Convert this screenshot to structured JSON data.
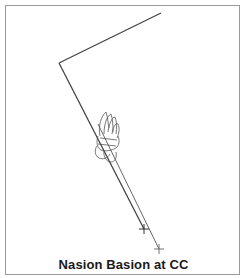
{
  "figure": {
    "caption": "Nasion Basion at CC",
    "line_color": "#444444",
    "outline_color": "#555555",
    "border_color": "#9a9a9a"
  },
  "geometry": {
    "frame": {
      "x": 5,
      "y": 5,
      "w": 235,
      "h": 270
    },
    "points": {
      "upper_end": {
        "x": 161,
        "y": 13
      },
      "vertex_N": {
        "x": 59,
        "y": 63
      },
      "cross_1": {
        "x": 144,
        "y": 229
      },
      "cross_2": {
        "x": 159,
        "y": 249
      }
    }
  }
}
